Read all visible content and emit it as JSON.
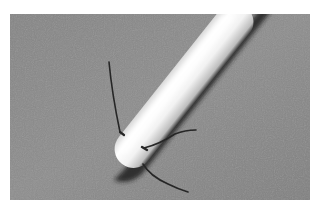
{
  "image": {
    "description": "Grayscale photograph of a white rounded rod/probe with thin dark wire whiskers near its tip, on a gray textured surface",
    "frame": {
      "x": 10,
      "y": 14,
      "width": 300,
      "height": 186
    },
    "colors": {
      "page_background": "#ffffff",
      "surface": "#8a8a8a",
      "surface_dark": "#7c7c7c",
      "rod_highlight": "#ffffff",
      "rod_body": "#ececec",
      "rod_shade": "#b8b8b8",
      "shadow": "#1e1e1e",
      "wire": "#2a2a2a"
    },
    "subjects": [
      {
        "name": "rod",
        "shape": "elongated cylinder with rounded tip",
        "orientation": "diagonal from lower-left tip to upper-right"
      },
      {
        "name": "wire-upper",
        "shape": "thin dark filament pointing up"
      },
      {
        "name": "wire-right",
        "shape": "thin dark filament pointing right"
      },
      {
        "name": "wire-lower",
        "shape": "thin curved dark filament pointing down-right"
      }
    ]
  }
}
